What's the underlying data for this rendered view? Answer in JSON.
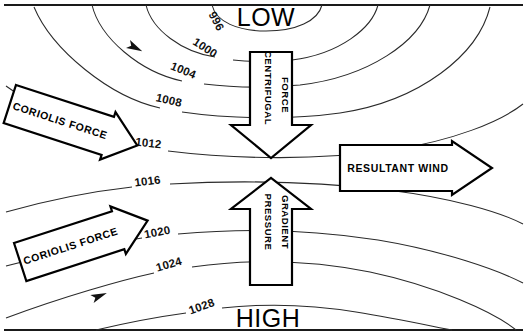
{
  "figure": {
    "background_color": "#ffffff",
    "line_color": "#2a2a2a",
    "frame_color": "#1a1a1a",
    "width": 527,
    "height": 335
  },
  "pressure_centers": {
    "low": "LOW",
    "high": "HIGH"
  },
  "isobars": [
    {
      "label": "996",
      "value": 996,
      "x": 180,
      "y": 16,
      "rotate": 58
    },
    {
      "label": "1000",
      "value": 1000,
      "x": 185,
      "y": 43,
      "rotate": 30
    },
    {
      "label": "1004",
      "value": 1004,
      "x": 166,
      "y": 70,
      "rotate": 20
    },
    {
      "label": "1008",
      "value": 1008,
      "x": 148,
      "y": 101,
      "rotate": 12
    },
    {
      "label": "1012",
      "value": 1012,
      "x": 138,
      "y": 143,
      "rotate": 5
    },
    {
      "label": "1016",
      "value": 1016,
      "x": 140,
      "y": 190,
      "rotate": -5
    },
    {
      "label": "1020",
      "value": 1020,
      "x": 148,
      "y": 238,
      "rotate": -12
    },
    {
      "label": "1024",
      "value": 1024,
      "x": 160,
      "y": 271,
      "rotate": -18
    },
    {
      "label": "1028",
      "value": 1028,
      "x": 192,
      "y": 313,
      "rotate": -22
    }
  ],
  "force_arrows": [
    {
      "id": "coriolis-upper",
      "label": "CORIOLIS FORCE",
      "direction": "right-down",
      "rotation_deg": 18,
      "style": "hollow-block-arrow"
    },
    {
      "id": "coriolis-lower",
      "label": "CORIOLIS FORCE",
      "direction": "right-up",
      "rotation_deg": -18,
      "style": "hollow-block-arrow"
    },
    {
      "id": "centrifugal",
      "label_line1": "CENTRIFUGAL",
      "label_line2": "FORCE",
      "direction": "down",
      "rotation_deg": 90,
      "style": "hollow-block-arrow"
    },
    {
      "id": "pressure-gradient",
      "label_line1": "PRESSURE",
      "label_line2": "GRADIENT",
      "direction": "up",
      "rotation_deg": 90,
      "style": "hollow-block-arrow"
    },
    {
      "id": "resultant-wind",
      "label": "RESULTANT WIND",
      "direction": "right",
      "rotation_deg": 0,
      "style": "hollow-block-arrow"
    }
  ],
  "flow_arrowheads": [
    {
      "on_isobar": "1004",
      "x": 120,
      "y": 41,
      "rotate": 26
    },
    {
      "on_isobar": "1012",
      "x": 100,
      "y": 130,
      "rotate": 14
    },
    {
      "on_isobar": "1020",
      "x": 88,
      "y": 245,
      "rotate": -16
    },
    {
      "on_isobar": "1024",
      "x": 92,
      "y": 296,
      "rotate": -22
    }
  ]
}
